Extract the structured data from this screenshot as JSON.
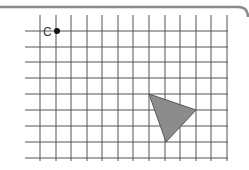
{
  "diagram": {
    "type": "grid-with-triangle",
    "frame_color": "#8a8a8a",
    "grid_color": "#555555",
    "grid": {
      "vertical_x": [
        40,
        56,
        71,
        87,
        102,
        118,
        133,
        149,
        165,
        180,
        196,
        211,
        227
      ],
      "horizontal_y": [
        31,
        47,
        62,
        78,
        94,
        110,
        126,
        142,
        158
      ],
      "vertical_y_range": [
        15,
        161
      ],
      "horizontal_x_range": [
        25,
        228
      ]
    },
    "point": {
      "label": "C",
      "x": 57,
      "y": 31,
      "color": "#111111"
    },
    "triangle": {
      "vertices": [
        [
          149,
          94
        ],
        [
          196,
          110
        ],
        [
          166,
          142
        ]
      ],
      "fill": "#8c8c8c",
      "stroke": "#555555"
    }
  }
}
